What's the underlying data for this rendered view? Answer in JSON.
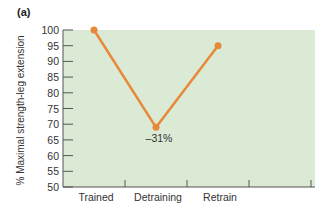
{
  "panel_label": "(a)",
  "chart_data": {
    "type": "line",
    "title": "",
    "xlabel": "",
    "ylabel": "% Maximal strength-leg extension",
    "categories": [
      "Trained",
      "Detraining",
      "Retrain"
    ],
    "series": [
      {
        "name": "Maximal strength",
        "values": [
          100,
          69,
          95
        ],
        "color": "#e8893a"
      }
    ],
    "annotations": [
      {
        "category": "Detraining",
        "text": "–31%"
      }
    ],
    "yticks": [
      50,
      55,
      60,
      65,
      70,
      75,
      80,
      85,
      90,
      95,
      100
    ],
    "ylim": [
      50,
      100
    ],
    "grid": false,
    "legend": "none",
    "plot_background": "#dbead5"
  }
}
